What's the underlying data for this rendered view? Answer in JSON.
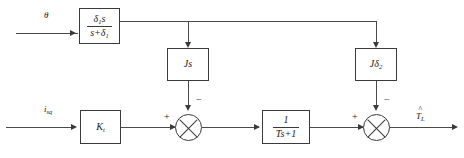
{
  "diagram": {
    "inputs": {
      "theta_label": "θ",
      "current_label_base": "i",
      "current_label_sub": "sq"
    },
    "output": {
      "label_base": "T",
      "label_sub": "L",
      "hat": "^"
    },
    "blocks": {
      "washout": {
        "numerator_base": "δ",
        "numerator_sub": "1",
        "numerator_tail": "s",
        "denominator_head": "s+δ",
        "denominator_sub": "1"
      },
      "inertia_s": {
        "label": "Js"
      },
      "inertia_delta": {
        "label_base": "Jδ",
        "label_sub": "2"
      },
      "torque_gain": {
        "label_base": "K",
        "label_sub": "t"
      },
      "lag_filter": {
        "numerator": "1",
        "denominator": "Ts+1"
      }
    },
    "summing_junctions": {
      "first": {
        "left_sign": "+",
        "top_sign": "−"
      },
      "second": {
        "left_sign": "+",
        "top_sign": "−"
      }
    },
    "colors": {
      "line": "#4a4a4a",
      "border": "#3a3a3a",
      "background": "#ffffff",
      "text": "#1a1a1a"
    }
  }
}
